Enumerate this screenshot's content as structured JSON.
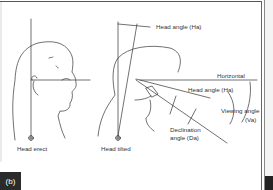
{
  "figure": {
    "panel_label": "(b)",
    "labels": {
      "head_angle_top": "Head angle (Ha)",
      "horizontal": "Horizontal",
      "head_angle_mid": "Head angle (Ha)",
      "viewing_angle_line1": "Viewing angle",
      "viewing_angle_line2": "(Va)",
      "declination_line1": "Declination",
      "declination_line2": "angle (Da)",
      "head_erect": "Head erect",
      "head_tilted": "Head tilted"
    },
    "colors": {
      "line": "#333333",
      "tab_background": "#2b2b2b",
      "tab_text": "#ffffff"
    }
  }
}
